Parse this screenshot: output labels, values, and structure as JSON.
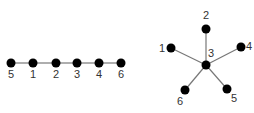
{
  "diagrams": [
    {
      "name": "path-graph",
      "nodes": [
        {
          "id": "5",
          "label": "5",
          "x": 11,
          "y": 63,
          "lx": 11,
          "ly": 78
        },
        {
          "id": "1",
          "label": "1",
          "x": 33,
          "y": 63,
          "lx": 33,
          "ly": 78
        },
        {
          "id": "2",
          "label": "2",
          "x": 56,
          "y": 63,
          "lx": 56,
          "ly": 78
        },
        {
          "id": "3",
          "label": "3",
          "x": 77,
          "y": 63,
          "lx": 77,
          "ly": 78
        },
        {
          "id": "4",
          "label": "4",
          "x": 99,
          "y": 63,
          "lx": 99,
          "ly": 78
        },
        {
          "id": "6",
          "label": "6",
          "x": 121,
          "y": 63,
          "lx": 121,
          "ly": 78
        }
      ],
      "edges": [
        [
          "5",
          "1"
        ],
        [
          "1",
          "2"
        ],
        [
          "2",
          "3"
        ],
        [
          "3",
          "4"
        ],
        [
          "4",
          "6"
        ]
      ]
    },
    {
      "name": "star-graph",
      "nodes": [
        {
          "id": "3",
          "label": "3",
          "x": 206,
          "y": 65,
          "lx": 211,
          "ly": 57
        },
        {
          "id": "2",
          "label": "2",
          "x": 206,
          "y": 29,
          "lx": 206,
          "ly": 19
        },
        {
          "id": "1",
          "label": "1",
          "x": 171,
          "y": 48,
          "lx": 162,
          "ly": 52
        },
        {
          "id": "4",
          "label": "4",
          "x": 241,
          "y": 47,
          "lx": 249,
          "ly": 50
        },
        {
          "id": "6",
          "label": "6",
          "x": 185,
          "y": 90,
          "lx": 180,
          "ly": 105
        },
        {
          "id": "5",
          "label": "5",
          "x": 227,
          "y": 89,
          "lx": 234,
          "ly": 102
        }
      ],
      "edges": [
        [
          "3",
          "2"
        ],
        [
          "3",
          "1"
        ],
        [
          "3",
          "4"
        ],
        [
          "3",
          "6"
        ],
        [
          "3",
          "5"
        ]
      ]
    }
  ],
  "colors": {
    "node": "#000000",
    "edge": "#777777",
    "label": "#333333"
  }
}
